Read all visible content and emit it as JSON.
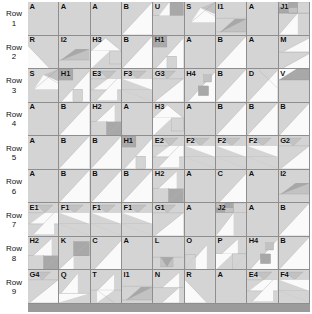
{
  "palette": {
    "cell_bg": "#d4d4d4",
    "light": "#efefef",
    "white": "#fafafa",
    "mid": "#c2c2c2",
    "dark": "#a8a8a8",
    "line": "#8e8e8e",
    "page_bg": "#ffffff",
    "text": "#0d0d0d"
  },
  "row_label_word": "Row",
  "rows": [
    {
      "number": "1",
      "label_word": "Row",
      "cells": [
        {
          "label": "A",
          "pattern": "plain"
        },
        {
          "label": "A",
          "pattern": "plain"
        },
        {
          "label": "A",
          "pattern": "plain"
        },
        {
          "label": "B",
          "pattern": "half-diag-light"
        },
        {
          "label": "U",
          "pattern": "u-block"
        },
        {
          "label": "S",
          "pattern": "s-block"
        },
        {
          "label": "I1",
          "pattern": "i1-block"
        },
        {
          "label": "A",
          "pattern": "plain"
        },
        {
          "label": "J1",
          "pattern": "j1-block"
        }
      ]
    },
    {
      "number": "2",
      "label_word": "Row",
      "cells": [
        {
          "label": "R",
          "pattern": "r-block"
        },
        {
          "label": "I2",
          "pattern": "i2-block"
        },
        {
          "label": "H3",
          "pattern": "h3-block"
        },
        {
          "label": "B",
          "pattern": "half-diag-light"
        },
        {
          "label": "H1",
          "pattern": "h1-block"
        },
        {
          "label": "A",
          "pattern": "plain"
        },
        {
          "label": "B",
          "pattern": "half-diag-light"
        },
        {
          "label": "A",
          "pattern": "plain"
        },
        {
          "label": "M",
          "pattern": "m-block"
        }
      ]
    },
    {
      "number": "3",
      "label_word": "Row",
      "cells": [
        {
          "label": "S",
          "pattern": "s-block"
        },
        {
          "label": "H1",
          "pattern": "h1-block"
        },
        {
          "label": "E3",
          "pattern": "e3-block"
        },
        {
          "label": "F3",
          "pattern": "f3-block"
        },
        {
          "label": "G3",
          "pattern": "g3-block"
        },
        {
          "label": "H4",
          "pattern": "h4-block"
        },
        {
          "label": "B",
          "pattern": "half-diag-light"
        },
        {
          "label": "D",
          "pattern": "d-block"
        },
        {
          "label": "V",
          "pattern": "v-block"
        }
      ]
    },
    {
      "number": "4",
      "label_word": "Row",
      "cells": [
        {
          "label": "A",
          "pattern": "plain"
        },
        {
          "label": "B",
          "pattern": "half-diag-light"
        },
        {
          "label": "H2",
          "pattern": "h2-block"
        },
        {
          "label": "A",
          "pattern": "plain"
        },
        {
          "label": "H3",
          "pattern": "h3-block"
        },
        {
          "label": "A",
          "pattern": "plain"
        },
        {
          "label": "B",
          "pattern": "half-diag-light"
        },
        {
          "label": "B",
          "pattern": "half-diag-light"
        },
        {
          "label": "B",
          "pattern": "half-diag-light"
        }
      ]
    },
    {
      "number": "5",
      "label_word": "Row",
      "cells": [
        {
          "label": "A",
          "pattern": "plain"
        },
        {
          "label": "B",
          "pattern": "half-diag-light"
        },
        {
          "label": "B",
          "pattern": "half-diag-light"
        },
        {
          "label": "H1",
          "pattern": "h1-block"
        },
        {
          "label": "E2",
          "pattern": "e2-block"
        },
        {
          "label": "F2",
          "pattern": "f2-block"
        },
        {
          "label": "F2",
          "pattern": "f2-block"
        },
        {
          "label": "F2",
          "pattern": "f2-block"
        },
        {
          "label": "G2",
          "pattern": "g2-block"
        }
      ]
    },
    {
      "number": "6",
      "label_word": "Row",
      "cells": [
        {
          "label": "A",
          "pattern": "plain"
        },
        {
          "label": "B",
          "pattern": "half-diag-light"
        },
        {
          "label": "B",
          "pattern": "half-diag-light"
        },
        {
          "label": "B",
          "pattern": "half-diag-light"
        },
        {
          "label": "H2",
          "pattern": "h2-block"
        },
        {
          "label": "A",
          "pattern": "plain"
        },
        {
          "label": "C",
          "pattern": "c-block"
        },
        {
          "label": "A",
          "pattern": "plain"
        },
        {
          "label": "I2",
          "pattern": "i2-block"
        }
      ]
    },
    {
      "number": "7",
      "label_word": "Row",
      "cells": [
        {
          "label": "E1",
          "pattern": "e1-block"
        },
        {
          "label": "F1",
          "pattern": "f1-block"
        },
        {
          "label": "F1",
          "pattern": "f1-block"
        },
        {
          "label": "F1",
          "pattern": "f1-block"
        },
        {
          "label": "G1",
          "pattern": "g1-block"
        },
        {
          "label": "A",
          "pattern": "plain"
        },
        {
          "label": "J2",
          "pattern": "j2-block"
        },
        {
          "label": "A",
          "pattern": "plain"
        },
        {
          "label": "B",
          "pattern": "half-diag-light"
        }
      ]
    },
    {
      "number": "8",
      "label_word": "Row",
      "cells": [
        {
          "label": "H2",
          "pattern": "h2-block"
        },
        {
          "label": "K",
          "pattern": "k-block"
        },
        {
          "label": "C",
          "pattern": "c-block"
        },
        {
          "label": "A",
          "pattern": "plain"
        },
        {
          "label": "L",
          "pattern": "l-block"
        },
        {
          "label": "O",
          "pattern": "o-block"
        },
        {
          "label": "P",
          "pattern": "p-block"
        },
        {
          "label": "H4",
          "pattern": "h4-block"
        },
        {
          "label": "B",
          "pattern": "half-diag-light"
        }
      ]
    },
    {
      "number": "9",
      "label_word": "Row",
      "cells": [
        {
          "label": "G4",
          "pattern": "g4-block"
        },
        {
          "label": "Q",
          "pattern": "q-block"
        },
        {
          "label": "T",
          "pattern": "t-block"
        },
        {
          "label": "I1",
          "pattern": "i1-block"
        },
        {
          "label": "N",
          "pattern": "n-block"
        },
        {
          "label": "R",
          "pattern": "r-block"
        },
        {
          "label": "A",
          "pattern": "plain"
        },
        {
          "label": "E4",
          "pattern": "e4-block"
        },
        {
          "label": "F4",
          "pattern": "f4-block"
        }
      ]
    }
  ]
}
